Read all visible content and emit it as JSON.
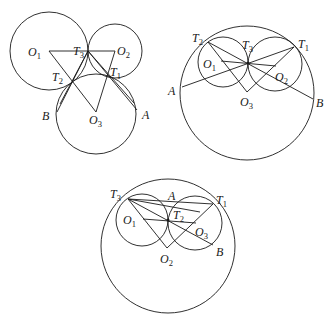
{
  "figures": [
    {
      "id": "fig1",
      "description": "Three mutually tangent circles, externally tangent",
      "labels": {
        "O1": {
          "main": "O",
          "sub": "1"
        },
        "O2": {
          "main": "O",
          "sub": "2"
        },
        "O3": {
          "main": "O",
          "sub": "3"
        },
        "T1": {
          "main": "T",
          "sub": "1"
        },
        "T2": {
          "main": "T",
          "sub": "2"
        },
        "T3": {
          "main": "T",
          "sub": "3"
        },
        "A": {
          "main": "A",
          "sub": ""
        },
        "B": {
          "main": "B",
          "sub": ""
        }
      }
    },
    {
      "id": "fig2",
      "description": "Two small circles internally tangent to a large circle",
      "labels": {
        "O1": {
          "main": "O",
          "sub": "1"
        },
        "O2": {
          "main": "O",
          "sub": "2"
        },
        "O3": {
          "main": "O",
          "sub": "3"
        },
        "T1": {
          "main": "T",
          "sub": "1"
        },
        "T2": {
          "main": "T",
          "sub": "2"
        },
        "T3": {
          "main": "T",
          "sub": "3"
        },
        "A": {
          "main": "A",
          "sub": ""
        },
        "B": {
          "main": "B",
          "sub": ""
        }
      }
    },
    {
      "id": "fig3",
      "description": "Two small circles internally tangent to a large circle, alternate labeling",
      "labels": {
        "O1": {
          "main": "O",
          "sub": "1"
        },
        "O2": {
          "main": "O",
          "sub": "2"
        },
        "O3": {
          "main": "O",
          "sub": "3"
        },
        "T1": {
          "main": "T",
          "sub": "1"
        },
        "T2": {
          "main": "T",
          "sub": "2"
        },
        "T3": {
          "main": "T",
          "sub": "3"
        },
        "A": {
          "main": "A",
          "sub": ""
        },
        "B": {
          "main": "B",
          "sub": ""
        }
      }
    }
  ]
}
